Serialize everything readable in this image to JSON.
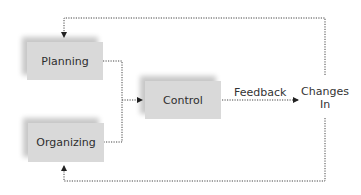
{
  "diagram": {
    "nodes": {
      "planning": {
        "label": "Planning"
      },
      "organizing": {
        "label": "Organizing"
      },
      "control": {
        "label": "Control"
      },
      "changes_in": {
        "line1": "Changes",
        "line2": "In"
      }
    },
    "edges": {
      "feedback": {
        "label": "Feedback"
      }
    },
    "colors": {
      "box_fill": "#d9d9d9",
      "line": "#333333",
      "text": "#2e2e2e"
    }
  }
}
